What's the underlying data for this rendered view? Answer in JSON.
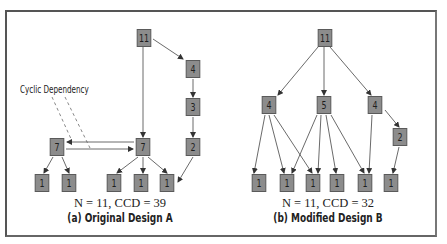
{
  "panel_a": {
    "metric": "N = 11, CCD = 39",
    "caption": "(a) Original Design A",
    "annotation": "Cyclic Dependency",
    "nodes": {
      "root": "11",
      "n4": "4",
      "n3": "3",
      "n2": "2",
      "n7_left": "7",
      "n7_right": "7",
      "leaf1": "1",
      "leaf2": "1",
      "leaf3": "1",
      "leaf4": "1",
      "leaf5": "1"
    }
  },
  "panel_b": {
    "metric": "N = 11, CCD = 32",
    "caption": "(b) Modified Design B",
    "nodes": {
      "root": "11",
      "n4_left": "4",
      "n5": "5",
      "n4_right": "4",
      "n2": "2",
      "leaf1": "1",
      "leaf2": "1",
      "leaf3": "1",
      "leaf4": "1",
      "leaf5": "1",
      "leaf6": "1"
    }
  },
  "colors": {
    "node_fill": "#8c8c8c",
    "node_border": "#5a5a5a",
    "edge": "#333333",
    "frame": "#555555"
  }
}
